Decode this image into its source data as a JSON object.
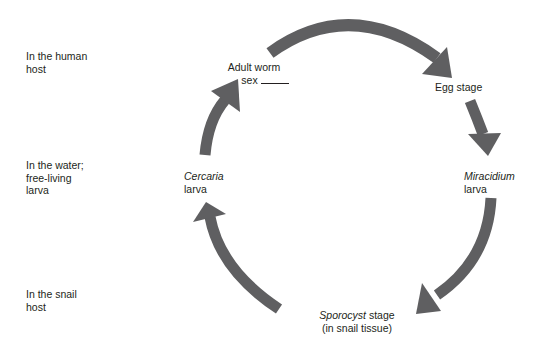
{
  "diagram": {
    "type": "life-cycle",
    "arrow_color": "#5f5f61",
    "background": "#ffffff",
    "text_color": "#231f20",
    "row_labels": [
      {
        "id": "human-host",
        "lines": [
          "In the human",
          "host"
        ]
      },
      {
        "id": "water",
        "lines": [
          "In the water;",
          "free-living",
          "larva"
        ]
      },
      {
        "id": "snail-host",
        "lines": [
          "In the snail",
          "host"
        ]
      }
    ],
    "stages": {
      "adult_worm": {
        "line1": "Adult worm",
        "line2_prefix": "sex",
        "blank": "______"
      },
      "egg": {
        "line1": "Egg stage"
      },
      "miracidium": {
        "italic": "Miracidium",
        "line2": "larva"
      },
      "sporocyst": {
        "italic": "Sporocyst",
        "line1_suffix": " stage",
        "line2": "(in snail tissue)"
      },
      "cercaria": {
        "italic": "Cercaria",
        "line2": "larva"
      }
    },
    "cycle_order": [
      "Adult worm",
      "Egg stage",
      "Miracidium larva",
      "Sporocyst stage",
      "Cercaria larva",
      "Adult worm"
    ]
  }
}
